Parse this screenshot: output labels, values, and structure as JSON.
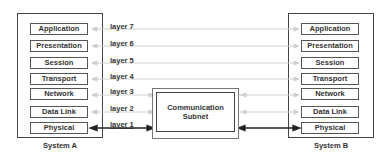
{
  "system_a": {
    "label": "System A",
    "layers": [
      "Application",
      "Presentation",
      "Session",
      "Transport",
      "Network",
      "Data Link",
      "Physical"
    ]
  },
  "system_b": {
    "label": "System B",
    "layers": [
      "Application",
      "Presentation",
      "Session",
      "Transport",
      "Network",
      "Data Link",
      "Physical"
    ]
  },
  "layer_labels": [
    "layer 7",
    "layer 6",
    "layer 5",
    "layer 4",
    "layer 3",
    "layer 2",
    "layer 1"
  ],
  "subnet": {
    "line1": "Communication",
    "line2": "Subnet"
  },
  "colors": {
    "peer_line": "#cccccc",
    "physical_line": "#222222",
    "box_border": "#444444"
  }
}
